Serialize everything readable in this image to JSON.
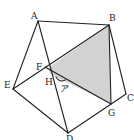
{
  "diagram": {
    "type": "geometry-figure",
    "colors": {
      "stroke": "#222222",
      "shade": "#d2d2d2",
      "background": "#ffffff"
    },
    "points": {
      "A": {
        "label": "A",
        "x": 38,
        "y": 21
      },
      "B": {
        "label": "B",
        "x": 109,
        "y": 25
      },
      "C": {
        "label": "C",
        "x": 126,
        "y": 94
      },
      "D": {
        "label": "D",
        "x": 68,
        "y": 133
      },
      "E": {
        "label": "E",
        "x": 13,
        "y": 89
      },
      "F": {
        "label": "F",
        "x": 48,
        "y": 68
      },
      "G": {
        "label": "G",
        "x": 111,
        "y": 104
      },
      "H": {
        "label": "H",
        "x": 50,
        "y": 74
      }
    },
    "angle_label": "ア",
    "shaded_region": [
      "B",
      "F",
      "H",
      "G"
    ]
  }
}
